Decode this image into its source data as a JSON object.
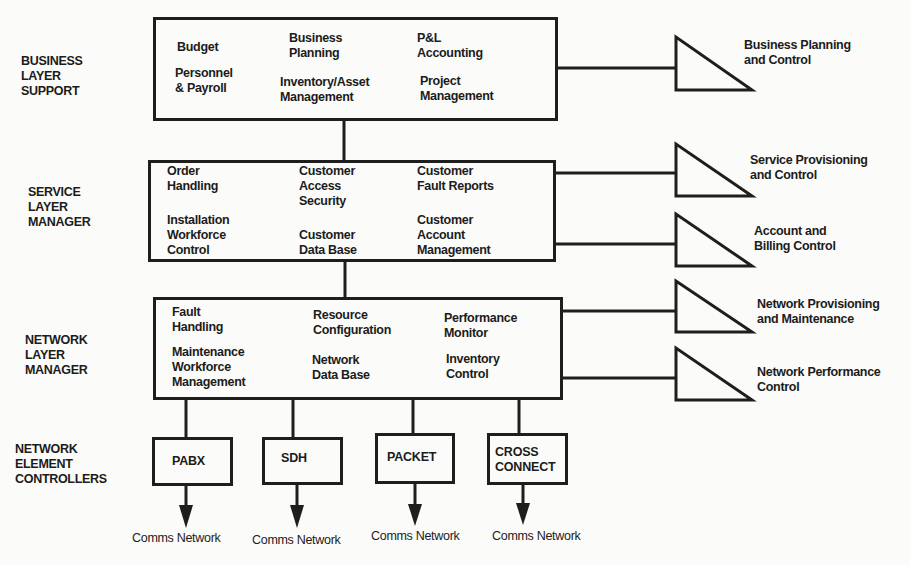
{
  "layers": [
    {
      "label_lines": [
        "BUSINESS",
        "LAYER",
        "SUPPORT"
      ],
      "functions": [
        {
          "lines": [
            "Budget"
          ]
        },
        {
          "lines": [
            "Business",
            "Planning"
          ]
        },
        {
          "lines": [
            "P&L",
            "Accounting"
          ]
        },
        {
          "lines": [
            "Personnel",
            "& Payroll"
          ]
        },
        {
          "lines": [
            "Inventory/Asset",
            "Management"
          ]
        },
        {
          "lines": [
            "Project",
            "Management"
          ]
        }
      ]
    },
    {
      "label_lines": [
        "SERVICE",
        "LAYER",
        "MANAGER"
      ],
      "functions": [
        {
          "lines": [
            "Order",
            "Handling"
          ]
        },
        {
          "lines": [
            "Customer",
            "Access",
            "Security"
          ]
        },
        {
          "lines": [
            "Customer",
            "Fault Reports"
          ]
        },
        {
          "lines": [
            "Installation",
            "Workforce",
            "Control"
          ]
        },
        {
          "lines": [
            "Customer",
            "Data Base"
          ]
        },
        {
          "lines": [
            "Customer",
            "Account",
            "Management"
          ]
        }
      ]
    },
    {
      "label_lines": [
        "NETWORK",
        "LAYER",
        "MANAGER"
      ],
      "functions": [
        {
          "lines": [
            "Fault",
            "Handling"
          ]
        },
        {
          "lines": [
            "Resource",
            "Configuration"
          ]
        },
        {
          "lines": [
            "Performance",
            "Monitor"
          ]
        },
        {
          "lines": [
            "Maintenance",
            "Workforce",
            "Management"
          ]
        },
        {
          "lines": [
            "Network",
            "Data Base"
          ]
        },
        {
          "lines": [
            "Inventory",
            "Control"
          ]
        }
      ]
    },
    {
      "label_lines": [
        "NETWORK",
        "ELEMENT",
        "CONTROLLERS"
      ]
    }
  ],
  "element_controllers": [
    {
      "label": "PABX",
      "output": "Comms Network"
    },
    {
      "label": "SDH",
      "output": "Comms Network"
    },
    {
      "label": "PACKET",
      "output": "Comms Network"
    },
    {
      "label": "CROSS\nCONNECT",
      "output": "Comms Network"
    }
  ],
  "control_interfaces": [
    {
      "lines": [
        "Business Planning",
        "and Control"
      ]
    },
    {
      "lines": [
        "Service Provisioning",
        "and Control"
      ]
    },
    {
      "lines": [
        "Account and",
        "Billing Control"
      ]
    },
    {
      "lines": [
        "Network Provisioning",
        "and Maintenance"
      ]
    },
    {
      "lines": [
        "Network Performance",
        "Control"
      ]
    }
  ],
  "colors": {
    "line": "#1e1e1e",
    "background": "#fbfbf9"
  }
}
